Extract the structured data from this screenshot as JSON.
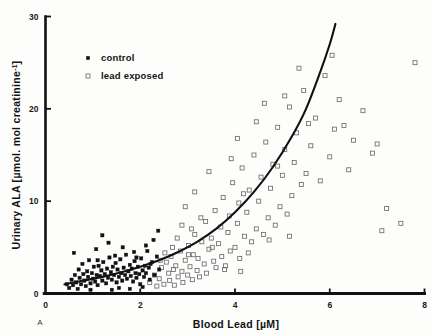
{
  "figure": {
    "panel_label": "A",
    "background": "#fdfdfc",
    "ink_color": "#111111"
  },
  "axes": {
    "x": {
      "label_main": "Blood Lead",
      "label_unit": "[µM]",
      "ticks": [
        "0",
        "2",
        "4",
        "6",
        "8"
      ],
      "tick_values": [
        0,
        2,
        4,
        6,
        8
      ],
      "range": [
        0,
        8
      ]
    },
    "y": {
      "label_main": "Urinary ALA",
      "label_unit_open": "[µmol. mol  creatinine",
      "label_unit_exp": "-1",
      "label_unit_close": "]",
      "ticks": [
        "0",
        "10",
        "20",
        "30"
      ],
      "tick_values": [
        0,
        10,
        20,
        30
      ],
      "range": [
        0,
        30
      ]
    }
  },
  "legend": {
    "items": [
      {
        "marker": "filled-square",
        "label": "control"
      },
      {
        "marker": "open-square",
        "label": "lead exposed"
      }
    ]
  },
  "chart_data": {
    "type": "scatter",
    "title": "",
    "xlabel": "Blood Lead [µM]",
    "ylabel": "Urinary ALA [µmol. mol creatinine-1]",
    "xlim": [
      0,
      8
    ],
    "ylim": [
      0,
      30
    ],
    "xticks": [
      0,
      2,
      4,
      6,
      8
    ],
    "yticks": [
      0,
      10,
      20,
      30
    ],
    "grid": false,
    "legend_position": "upper-left-inside",
    "series": [
      {
        "name": "control",
        "marker": "filled-square",
        "color": "#111111",
        "points": [
          [
            0.45,
            1.0
          ],
          [
            0.5,
            0.6
          ],
          [
            0.55,
            1.5
          ],
          [
            0.58,
            0.9
          ],
          [
            0.62,
            2.0
          ],
          [
            0.65,
            1.2
          ],
          [
            0.68,
            0.5
          ],
          [
            0.7,
            2.6
          ],
          [
            0.72,
            1.7
          ],
          [
            0.75,
            1.0
          ],
          [
            0.78,
            3.2
          ],
          [
            0.8,
            2.1
          ],
          [
            0.82,
            1.4
          ],
          [
            0.85,
            0.8
          ],
          [
            0.88,
            2.4
          ],
          [
            0.9,
            1.8
          ],
          [
            0.92,
            3.6
          ],
          [
            0.95,
            1.1
          ],
          [
            0.98,
            2.2
          ],
          [
            1.0,
            1.6
          ],
          [
            1.02,
            2.9
          ],
          [
            1.05,
            1.3
          ],
          [
            1.08,
            2.0
          ],
          [
            1.1,
            0.9
          ],
          [
            1.12,
            3.0
          ],
          [
            1.15,
            1.9
          ],
          [
            1.18,
            2.5
          ],
          [
            1.2,
            1.4
          ],
          [
            1.22,
            3.4
          ],
          [
            1.25,
            2.1
          ],
          [
            1.28,
            1.1
          ],
          [
            1.3,
            2.7
          ],
          [
            1.32,
            1.7
          ],
          [
            1.35,
            3.9
          ],
          [
            1.38,
            2.3
          ],
          [
            1.4,
            1.5
          ],
          [
            1.42,
            2.9
          ],
          [
            1.45,
            2.0
          ],
          [
            1.48,
            3.3
          ],
          [
            1.5,
            1.2
          ],
          [
            1.52,
            2.6
          ],
          [
            1.55,
            1.8
          ],
          [
            1.58,
            3.7
          ],
          [
            1.6,
            2.2
          ],
          [
            1.62,
            1.4
          ],
          [
            1.65,
            2.8
          ],
          [
            1.68,
            2.0
          ],
          [
            1.7,
            4.2
          ],
          [
            1.72,
            1.6
          ],
          [
            1.75,
            2.4
          ],
          [
            1.78,
            3.1
          ],
          [
            1.8,
            1.9
          ],
          [
            1.82,
            2.7
          ],
          [
            1.85,
            1.3
          ],
          [
            1.88,
            3.5
          ],
          [
            1.9,
            2.2
          ],
          [
            1.92,
            1.7
          ],
          [
            1.95,
            2.9
          ],
          [
            1.98,
            2.1
          ],
          [
            2.0,
            1.0
          ],
          [
            2.02,
            3.8
          ],
          [
            2.05,
            2.5
          ],
          [
            2.08,
            1.8
          ],
          [
            2.1,
            3.0
          ],
          [
            2.12,
            2.2
          ],
          [
            2.15,
            4.6
          ],
          [
            2.18,
            2.8
          ],
          [
            2.2,
            1.5
          ],
          [
            2.25,
            3.4
          ],
          [
            2.3,
            2.0
          ],
          [
            2.35,
            4.0
          ],
          [
            2.4,
            2.6
          ],
          [
            0.6,
            4.4
          ],
          [
            1.07,
            4.8
          ],
          [
            1.33,
            5.5
          ],
          [
            1.47,
            4.1
          ],
          [
            1.63,
            5.0
          ],
          [
            1.87,
            4.5
          ],
          [
            2.12,
            5.2
          ],
          [
            2.28,
            5.8
          ],
          [
            1.2,
            6.3
          ],
          [
            2.38,
            6.8
          ],
          [
            0.95,
            0.4
          ],
          [
            1.55,
            0.6
          ],
          [
            1.78,
            0.5
          ],
          [
            2.05,
            0.7
          ],
          [
            1.4,
            0.4
          ],
          [
            1.92,
            3.9
          ],
          [
            2.22,
            3.2
          ],
          [
            1.1,
            3.6
          ]
        ]
      },
      {
        "name": "lead exposed",
        "marker": "open-square",
        "color": "#6d6d6d",
        "points": [
          [
            2.2,
            1.2
          ],
          [
            2.3,
            2.0
          ],
          [
            2.35,
            0.8
          ],
          [
            2.4,
            1.6
          ],
          [
            2.45,
            2.8
          ],
          [
            2.5,
            1.0
          ],
          [
            2.55,
            3.4
          ],
          [
            2.6,
            2.2
          ],
          [
            2.62,
            1.4
          ],
          [
            2.65,
            4.0
          ],
          [
            2.7,
            2.6
          ],
          [
            2.72,
            0.9
          ],
          [
            2.75,
            3.0
          ],
          [
            2.8,
            1.8
          ],
          [
            2.85,
            4.6
          ],
          [
            2.88,
            2.4
          ],
          [
            2.9,
            1.2
          ],
          [
            2.95,
            3.6
          ],
          [
            3.0,
            2.0
          ],
          [
            3.02,
            5.2
          ],
          [
            3.05,
            2.9
          ],
          [
            3.1,
            1.5
          ],
          [
            3.12,
            4.2
          ],
          [
            3.15,
            6.4
          ],
          [
            3.2,
            2.5
          ],
          [
            3.22,
            3.8
          ],
          [
            3.25,
            1.8
          ],
          [
            3.3,
            5.6
          ],
          [
            3.35,
            3.2
          ],
          [
            3.38,
            7.8
          ],
          [
            3.4,
            2.2
          ],
          [
            3.45,
            4.8
          ],
          [
            3.5,
            6.0
          ],
          [
            3.55,
            3.5
          ],
          [
            3.58,
            9.0
          ],
          [
            3.6,
            2.8
          ],
          [
            3.65,
            5.4
          ],
          [
            3.7,
            7.2
          ],
          [
            3.72,
            4.0
          ],
          [
            3.75,
            10.4
          ],
          [
            3.8,
            3.0
          ],
          [
            3.85,
            6.6
          ],
          [
            3.88,
            8.4
          ],
          [
            3.9,
            4.6
          ],
          [
            3.95,
            12.0
          ],
          [
            4.0,
            5.0
          ],
          [
            4.05,
            7.6
          ],
          [
            4.08,
            9.8
          ],
          [
            4.1,
            3.8
          ],
          [
            4.15,
            13.6
          ],
          [
            4.2,
            6.2
          ],
          [
            4.25,
            8.8
          ],
          [
            4.3,
            11.2
          ],
          [
            4.35,
            5.6
          ],
          [
            4.4,
            15.0
          ],
          [
            4.45,
            7.0
          ],
          [
            4.5,
            10.0
          ],
          [
            4.55,
            12.6
          ],
          [
            4.6,
            6.4
          ],
          [
            4.65,
            16.4
          ],
          [
            4.7,
            8.2
          ],
          [
            4.75,
            11.4
          ],
          [
            4.8,
            14.0
          ],
          [
            4.85,
            7.4
          ],
          [
            4.9,
            18.0
          ],
          [
            4.95,
            9.4
          ],
          [
            5.0,
            12.8
          ],
          [
            5.05,
            15.6
          ],
          [
            5.1,
            8.6
          ],
          [
            5.15,
            20.2
          ],
          [
            5.2,
            10.6
          ],
          [
            5.25,
            14.2
          ],
          [
            5.3,
            17.4
          ],
          [
            5.4,
            11.8
          ],
          [
            5.45,
            22.0
          ],
          [
            5.5,
            13.0
          ],
          [
            5.6,
            16.0
          ],
          [
            5.7,
            19.0
          ],
          [
            5.8,
            12.2
          ],
          [
            5.9,
            23.6
          ],
          [
            6.0,
            14.8
          ],
          [
            6.1,
            17.8
          ],
          [
            6.2,
            21.0
          ],
          [
            6.4,
            13.4
          ],
          [
            6.5,
            16.6
          ],
          [
            6.7,
            19.8
          ],
          [
            6.9,
            15.2
          ],
          [
            7.0,
            16.2
          ],
          [
            7.1,
            6.8
          ],
          [
            7.2,
            9.2
          ],
          [
            7.5,
            7.6
          ],
          [
            7.8,
            25.0
          ],
          [
            3.15,
            11.0
          ],
          [
            3.45,
            13.2
          ],
          [
            2.95,
            9.4
          ],
          [
            4.45,
            18.6
          ],
          [
            4.05,
            16.8
          ],
          [
            5.35,
            24.4
          ],
          [
            5.05,
            21.4
          ],
          [
            4.62,
            20.6
          ],
          [
            3.92,
            14.6
          ],
          [
            2.78,
            6.0
          ],
          [
            2.52,
            4.4
          ],
          [
            3.28,
            8.2
          ],
          [
            6.05,
            25.8
          ],
          [
            2.42,
            3.6
          ],
          [
            2.68,
            5.0
          ],
          [
            3.08,
            7.0
          ],
          [
            4.18,
            10.8
          ],
          [
            5.55,
            18.4
          ],
          [
            4.9,
            13.8
          ],
          [
            6.3,
            18.2
          ],
          [
            3.02,
            4.2
          ],
          [
            2.88,
            7.4
          ],
          [
            3.52,
            5.0
          ],
          [
            4.28,
            4.4
          ],
          [
            4.72,
            5.8
          ],
          [
            5.15,
            6.2
          ],
          [
            3.78,
            2.6
          ],
          [
            4.12,
            2.4
          ]
        ]
      }
    ],
    "fit_curve": {
      "name": "exponential fit",
      "description": "monotonic rising curve through the data",
      "x_start": 0.4,
      "x_end": 6.12,
      "y_start": 1.0,
      "y_end": 29.2,
      "points": [
        [
          0.4,
          1.0
        ],
        [
          0.8,
          1.4
        ],
        [
          1.2,
          1.8
        ],
        [
          1.6,
          2.3
        ],
        [
          2.0,
          2.9
        ],
        [
          2.4,
          3.6
        ],
        [
          2.8,
          4.5
        ],
        [
          3.2,
          5.6
        ],
        [
          3.6,
          7.0
        ],
        [
          4.0,
          8.8
        ],
        [
          4.4,
          11.0
        ],
        [
          4.8,
          13.7
        ],
        [
          5.2,
          17.0
        ],
        [
          5.5,
          20.0
        ],
        [
          5.8,
          24.0
        ],
        [
          6.0,
          27.0
        ],
        [
          6.12,
          29.2
        ]
      ]
    }
  }
}
